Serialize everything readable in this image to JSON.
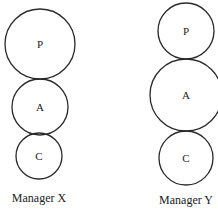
{
  "diagram": {
    "figures": [
      {
        "caption": "Manager X",
        "circles": [
          {
            "label": "P",
            "cx": 40,
            "cy": 44,
            "r": 35
          },
          {
            "label": "A",
            "cx": 40,
            "cy": 107,
            "r": 28
          },
          {
            "label": "C",
            "cx": 39,
            "cy": 156,
            "r": 23
          }
        ],
        "caption_pos": {
          "x": 39,
          "y": 199
        }
      },
      {
        "caption": "Manager Y",
        "circles": [
          {
            "label": "P",
            "cx": 186,
            "cy": 31,
            "r": 28
          },
          {
            "label": "A",
            "cx": 186,
            "cy": 95,
            "r": 36
          },
          {
            "label": "C",
            "cx": 186,
            "cy": 158,
            "r": 27
          }
        ],
        "caption_pos": {
          "x": 186,
          "y": 201
        }
      }
    ]
  }
}
